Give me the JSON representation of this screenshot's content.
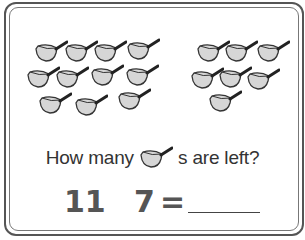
{
  "worksheet": {
    "question_prefix": "How many",
    "question_suffix": "s are left?",
    "question_icon": "pot-icon",
    "equation": {
      "minuend": "11",
      "operator_hidden": "",
      "subtrahend": "7",
      "equals": "=",
      "answer": ""
    },
    "left_group_count": 11,
    "right_group_count": 7
  },
  "colors": {
    "pot_fill": "#d6d6d6",
    "outline": "#333333",
    "text": "#333333",
    "equation": "#555555"
  }
}
